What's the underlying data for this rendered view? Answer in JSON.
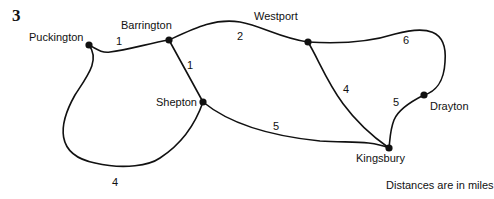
{
  "question_number": "3",
  "nodes": [
    {
      "id": "puckington",
      "label": "Puckington",
      "x": 89,
      "y": 45
    },
    {
      "id": "barrington",
      "label": "Barrington",
      "x": 169,
      "y": 40
    },
    {
      "id": "westport",
      "label": "Westport",
      "x": 308,
      "y": 42
    },
    {
      "id": "shepton",
      "label": "Shepton",
      "x": 203,
      "y": 102
    },
    {
      "id": "drayton",
      "label": "Drayton",
      "x": 424,
      "y": 95
    },
    {
      "id": "kingsbury",
      "label": "Kingsbury",
      "x": 389,
      "y": 148
    }
  ],
  "edges": [
    {
      "from": "Puckington",
      "to": "Barrington",
      "weight": "1"
    },
    {
      "from": "Barrington",
      "to": "Westport",
      "weight": "2"
    },
    {
      "from": "Barrington",
      "to": "Shepton",
      "weight": "1"
    },
    {
      "from": "Westport",
      "to": "Drayton",
      "weight": "6"
    },
    {
      "from": "Westport",
      "to": "Kingsbury",
      "weight": "4"
    },
    {
      "from": "Drayton",
      "to": "Kingsbury",
      "weight": "5"
    },
    {
      "from": "Shepton",
      "to": "Kingsbury",
      "weight": "5"
    },
    {
      "from": "Puckington",
      "to": "Shepton",
      "weight": "4"
    }
  ],
  "note": "Distances are in miles",
  "colors": {
    "line": "#111111",
    "background": "#ffffff"
  }
}
